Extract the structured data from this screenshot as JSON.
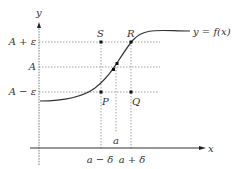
{
  "diagram": {
    "curve_label": "y = f(x)",
    "axes": {
      "x_label": "x",
      "y_label": "y"
    },
    "y_ticks": [
      {
        "label": "A + ε",
        "y": 42
      },
      {
        "label": "A",
        "y": 67
      },
      {
        "label": "A − ε",
        "y": 92
      }
    ],
    "x_ticks": [
      {
        "label": "a − δ",
        "x": 101
      },
      {
        "label": "a",
        "x": 116
      },
      {
        "label": "a + δ",
        "x": 131
      }
    ],
    "points": [
      {
        "label": "S",
        "x": 101,
        "y": 42
      },
      {
        "label": "R",
        "x": 131,
        "y": 42
      },
      {
        "label": "P",
        "x": 101,
        "y": 92
      },
      {
        "label": "Q",
        "x": 131,
        "y": 92
      }
    ],
    "colors": {
      "curve": "#333333",
      "axis": "#333333",
      "dotted": "#777777"
    }
  }
}
